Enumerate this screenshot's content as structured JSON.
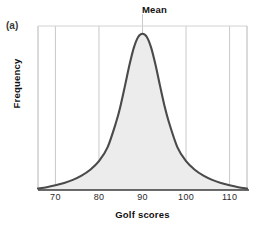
{
  "figure": {
    "panel_label": "(a)",
    "background_color": "#ffffff"
  },
  "chart_data": {
    "type": "area",
    "title": "Mean",
    "xlabel": "Golf scores",
    "ylabel": "Frequency",
    "grid": true,
    "grid_axis": "x",
    "legend": "none",
    "xlim": [
      66,
      114
    ],
    "ylim": [
      0,
      1.05
    ],
    "xticks": [
      70,
      80,
      90,
      100,
      110
    ],
    "xtick_labels": [
      "70",
      "80",
      "90",
      "100",
      "110"
    ],
    "yticks": [],
    "ytick_labels": [],
    "annotations": [
      {
        "text": "Mean",
        "x": 90,
        "position": "above-plot",
        "points_to": "center-vertical-gridline"
      }
    ],
    "distribution": {
      "shape": "symmetric bell curve (unimodal, heavy-tailed)",
      "mean": 90,
      "median": 90,
      "mode": 90,
      "peak_x": 90
    },
    "colors": {
      "curve": "#4a4a4a",
      "fill": "#ececec",
      "grid": "#c9c9c9",
      "axis": "#3a3a3a"
    },
    "x": [
      66,
      68,
      70,
      72,
      74,
      76,
      78,
      80,
      82,
      84,
      85,
      86,
      87,
      88,
      89,
      90,
      91,
      92,
      93,
      94,
      95,
      96,
      98,
      100,
      102,
      104,
      106,
      108,
      110,
      112,
      114
    ],
    "y": [
      0.01,
      0.018,
      0.03,
      0.045,
      0.065,
      0.092,
      0.13,
      0.185,
      0.275,
      0.44,
      0.545,
      0.67,
      0.8,
      0.91,
      0.98,
      1.0,
      0.98,
      0.91,
      0.8,
      0.67,
      0.545,
      0.44,
      0.275,
      0.185,
      0.13,
      0.092,
      0.065,
      0.045,
      0.03,
      0.018,
      0.01
    ]
  },
  "plot_geometry": {
    "left": 38,
    "right": 247,
    "top": 26,
    "baseline": 190
  }
}
